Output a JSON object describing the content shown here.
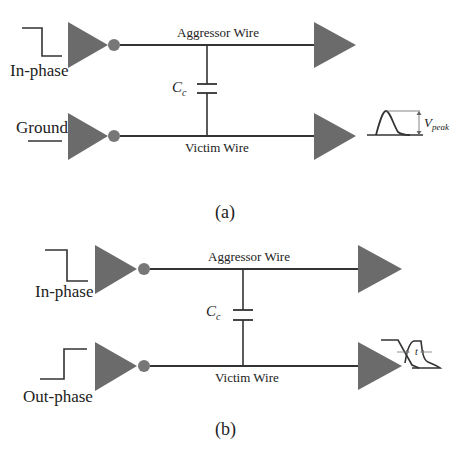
{
  "colors": {
    "buffer_fill": "#6b6b6b",
    "wire": "#333333",
    "background": "#ffffff",
    "text": "#222222"
  },
  "panels": [
    {
      "caption": "(a)",
      "aggressor_label": "Aggressor Wire",
      "victim_label": "Victim Wire",
      "capacitor_label": "C",
      "capacitor_subscript": "c",
      "top_input_label": "In-phase",
      "top_input_waveform": "falling-step",
      "bottom_input_label": "Ground",
      "bottom_input_waveform": "flat-low",
      "output_waveform": "noise-pulse",
      "output_annotation": "V",
      "output_annotation_subscript": "peak"
    },
    {
      "caption": "(b)",
      "aggressor_label": "Aggressor Wire",
      "victim_label": "Victim Wire",
      "capacitor_label": "C",
      "capacitor_subscript": "c",
      "top_input_label": "In-phase",
      "top_input_waveform": "falling-step",
      "bottom_input_label": "Out-phase",
      "bottom_input_waveform": "rising-step",
      "output_waveform": "delayed-transition",
      "output_annotation": "t"
    }
  ]
}
